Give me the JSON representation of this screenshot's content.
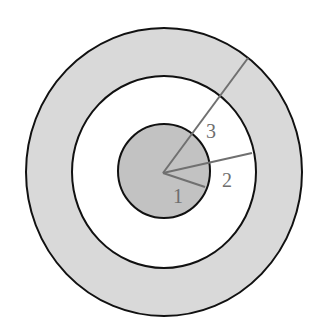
{
  "diagram": {
    "type": "concentric-circles-radii",
    "colors": {
      "background": "#ffffff",
      "outer_ring_fill": "#d9d9d9",
      "middle_ring_fill": "#ffffff",
      "inner_disc_fill": "#c2c2c2",
      "circle_stroke": "#111111",
      "radius_line": "#707070",
      "label": "#6e6e6e"
    },
    "center": {
      "x": 163,
      "y": 172
    },
    "circles": [
      {
        "name": "outer",
        "rx": 138,
        "ry": 144
      },
      {
        "name": "middle",
        "rx": 92,
        "ry": 96
      },
      {
        "name": "inner",
        "rx": 46,
        "ry": 47
      }
    ],
    "radii": [
      {
        "label": "1",
        "end": {
          "x": 205,
          "y": 187
        },
        "label_pos": {
          "x": 173,
          "y": 203
        }
      },
      {
        "label": "2",
        "end": {
          "x": 252,
          "y": 153
        },
        "label_pos": {
          "x": 222,
          "y": 187
        }
      },
      {
        "label": "3",
        "end": {
          "x": 248,
          "y": 58
        },
        "label_pos": {
          "x": 206,
          "y": 138
        }
      }
    ]
  }
}
